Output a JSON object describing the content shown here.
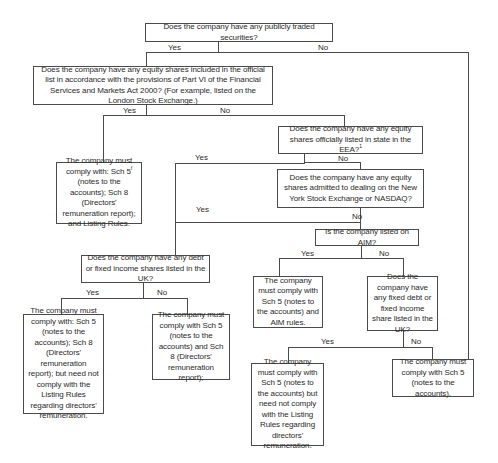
{
  "diagram": {
    "type": "decision-flowchart",
    "nodes": {
      "q_public": {
        "text": "Does the company have any publicly traded securities?"
      },
      "q_official_list": {
        "text": "Does the company have any equity shares included in the official list in accordance with the provisions of Part VI of the Financial Services and Markets Act 2000? (For example, listed on the London Stock Exchange.)"
      },
      "r_listed": {
        "text": "The company must comply with: Sch 5",
        "sup": "f",
        "text2": " (notes to the accounts); Sch 8 (Directors' remuneration report); and Listing Rules."
      },
      "q_eea": {
        "text": "Does the company have any equity shares officially listed in state in the EEA?",
        "sup": "1"
      },
      "q_nyse": {
        "text": "Does the company have any equity shares admitted to dealing on the New York Stock Exchange or NASDAQ?"
      },
      "q_aim": {
        "text": "Is the company listed on AIM?"
      },
      "q_debt_uk": {
        "text": "Does the company have any debt or fixed income shares listed in the UK?"
      },
      "r_debt_yes": {
        "text": "The company must comply with: Sch 5 (notes to the accounts); Sch 8 (Directors' remuneration report); but need not comply with the Listing Rules regarding directors' remuneration."
      },
      "r_debt_no": {
        "text": "The company must comply with Sch 5 (notes to the accounts) and Sch 8 (Directors' remuneration report);"
      },
      "r_aim_yes": {
        "text": "The company must comply with Sch 5 (notes to the accounts) and AIM rules."
      },
      "q_fixed_debt": {
        "text": "Does the company have any fixed debt or fixed income share listed in the UK?"
      },
      "r_fixed_yes": {
        "text": "The company must comply with Sch 5 (notes to the accounts) but need not comply with the Listing Rules regarding directors' remuneration."
      },
      "r_final": {
        "text": "The company must comply with Sch 5 (notes to the accounts)."
      }
    },
    "labels": {
      "yes": "Yes",
      "no": "No"
    }
  }
}
